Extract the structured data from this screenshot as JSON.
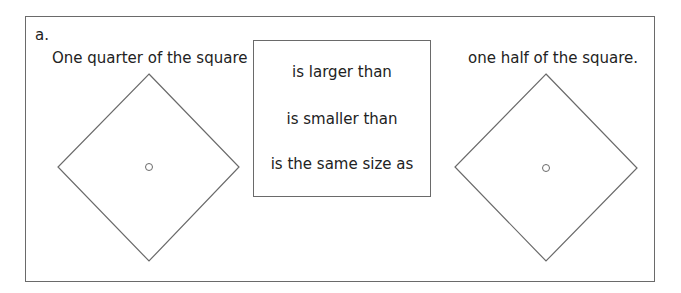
{
  "exercise": {
    "label": "a.",
    "left_caption": "One quarter of the square",
    "right_caption": "one half of the square.",
    "options": [
      "is larger than",
      "is smaller than",
      "is the same size as"
    ]
  },
  "shapes": {
    "left": {
      "type": "diamond",
      "center_mark": "small-circle"
    },
    "right": {
      "type": "diamond",
      "center_mark": "small-circle"
    }
  },
  "colors": {
    "stroke": "#6a6a6a",
    "background": "#ffffff"
  }
}
